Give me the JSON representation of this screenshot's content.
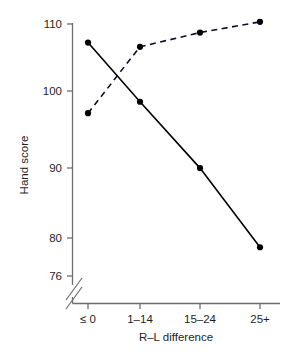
{
  "chart_data": {
    "type": "line",
    "title": "",
    "xlabel": "R–L difference",
    "ylabel": "Hand score",
    "categories": [
      "≤ 0",
      "1–14",
      "15–24",
      "25+"
    ],
    "ylim": [
      76,
      111
    ],
    "yticks": [
      110,
      100,
      90,
      80,
      76
    ],
    "ytick_labels": [
      "110",
      "100",
      "90",
      "80",
      "76"
    ],
    "axis_break": true,
    "axis_break_note": "y-axis broken below 76",
    "grid": false,
    "legend": "none",
    "series": [
      {
        "name": "solid-series",
        "style": "solid",
        "color": "#000000",
        "marker": "filled-circle",
        "values": [
          107.4,
          99.1,
          89.8,
          78.7
        ]
      },
      {
        "name": "dashed-series",
        "style": "dashed",
        "color": "#0d0d2b",
        "marker": "filled-circle",
        "values": [
          97.5,
          106.8,
          108.8,
          110.3
        ]
      }
    ]
  },
  "axes": {
    "y_title": "Hand score",
    "x_title": "R–L difference",
    "y_tick_110": "110",
    "y_tick_100": "100",
    "y_tick_90": "90",
    "y_tick_80": "80",
    "y_tick_76": "76",
    "x_tick_0": "≤ 0",
    "x_tick_1": "1–14",
    "x_tick_2": "15–24",
    "x_tick_3": "25+"
  }
}
